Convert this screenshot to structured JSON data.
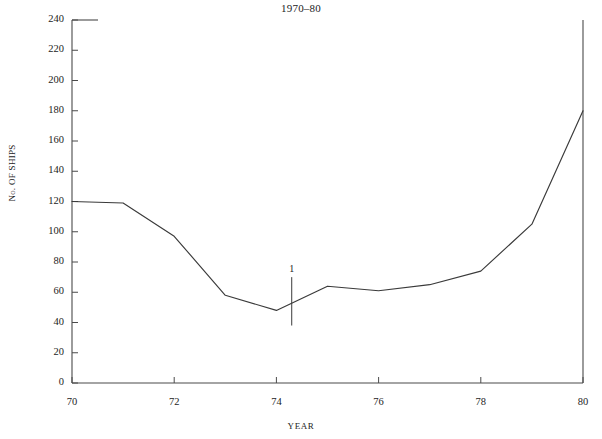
{
  "chart_data": {
    "type": "line",
    "title": "1970–80",
    "xlabel": "YEAR",
    "ylabel": "No. OF SHIPS",
    "x": [
      70,
      71,
      72,
      73,
      74,
      75,
      76,
      77,
      78,
      79,
      80
    ],
    "values": [
      120,
      119,
      97,
      58,
      48,
      64,
      61,
      65,
      74,
      105,
      180
    ],
    "series": [
      {
        "name": "No. of ships",
        "values": [
          120,
          119,
          97,
          58,
          48,
          64,
          61,
          65,
          74,
          105,
          180
        ]
      }
    ],
    "xlim": [
      70,
      80
    ],
    "ylim": [
      0,
      240
    ],
    "xticks": [
      70,
      72,
      74,
      76,
      78,
      80
    ],
    "xtick_labels": [
      "70",
      "72",
      "74",
      "76",
      "78",
      "80"
    ],
    "yticks": [
      0,
      20,
      40,
      60,
      80,
      100,
      120,
      140,
      160,
      180,
      200,
      220,
      240
    ],
    "ytick_labels": [
      "0",
      "20",
      "40",
      "60",
      "80",
      "100",
      "120",
      "140",
      "160",
      "180",
      "200",
      "220",
      "240"
    ],
    "grid": false,
    "legend": null,
    "line_color": "#3a3a3a",
    "axis_color": "#4a4a4a",
    "background": "#ffffff",
    "annotations": [
      {
        "label": "1",
        "x": 74.3,
        "y_top": 70,
        "y_bottom": 38,
        "kind": "vertical-tick-marker"
      }
    ]
  }
}
